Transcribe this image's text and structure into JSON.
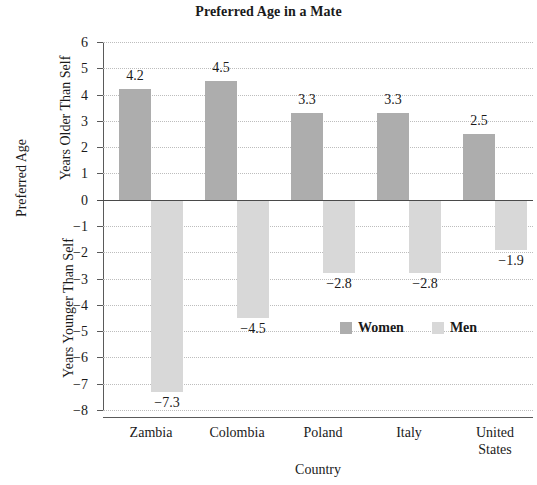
{
  "chart_data": {
    "type": "bar",
    "title": "Preferred Age in a Mate",
    "xlabel": "Country",
    "ylabel": "Preferred Age",
    "ylabel_upper": "Years Older Than Self",
    "ylabel_lower": "Years Younger Than Self",
    "categories": [
      "Zambia",
      "Colombia",
      "Poland",
      "Italy",
      "United States"
    ],
    "series": [
      {
        "name": "Women",
        "color": "#adadad",
        "values": [
          4.2,
          4.5,
          3.3,
          3.3,
          2.5
        ],
        "labels": [
          "4.2",
          "4.5",
          "3.3",
          "3.3",
          "2.5"
        ]
      },
      {
        "name": "Men",
        "color": "#d8d8d8",
        "values": [
          -7.3,
          -4.5,
          -2.8,
          -2.8,
          -1.9
        ],
        "labels": [
          "−7.3",
          "−4.5",
          "−2.8",
          "−2.8",
          "−1.9"
        ]
      }
    ],
    "ylim": [
      -8,
      6
    ],
    "yticks": [
      6,
      5,
      4,
      3,
      2,
      1,
      0,
      -1,
      -2,
      -3,
      -4,
      -5,
      -6,
      -7,
      -8
    ],
    "ytick_labels": [
      "6",
      "5",
      "4",
      "3",
      "2",
      "1",
      "0",
      "−1",
      "−2",
      "−3",
      "−4",
      "−5",
      "−6",
      "−7",
      "−8"
    ],
    "grid": true,
    "legend_position": "inside-lower-right",
    "legend": [
      "Women",
      "Men"
    ]
  },
  "legend": {
    "women_label": "Women",
    "men_label": "Men"
  },
  "x_labels": {
    "zambia": "Zambia",
    "colombia": "Colombia",
    "poland": "Poland",
    "italy": "Italy",
    "united_states_line1": "United",
    "united_states_line2": "States"
  }
}
